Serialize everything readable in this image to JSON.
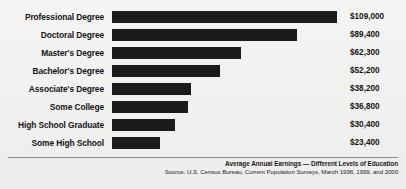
{
  "chart_data": {
    "type": "bar",
    "orientation": "horizontal",
    "title": "Average Annual Earnings — Different Levels of Education",
    "source": "Source: U.S. Census Bureau, Current Population Surveys, March 1998, 1999, and 2000",
    "xlabel": "",
    "ylabel": "",
    "grid": false,
    "legend": "none",
    "xlim": [
      0,
      109000
    ],
    "categories": [
      "Professional Degree",
      "Doctoral Degree",
      "Master's Degree",
      "Bachelor's Degree",
      "Associate's Degree",
      "Some College",
      "High School Graduate",
      "Some High School"
    ],
    "values": [
      109000,
      89400,
      62300,
      52200,
      38200,
      36800,
      30400,
      23400
    ],
    "value_labels": [
      "$109,000",
      "$89,400",
      "$62,300",
      "$52,200",
      "$38,200",
      "$36,800",
      "$30,400",
      "$23,400"
    ],
    "bar_color": "#1b1b1b",
    "background_color": "#f1f1ef"
  }
}
